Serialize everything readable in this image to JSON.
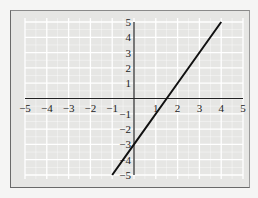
{
  "chart_data": {
    "type": "line",
    "title": "",
    "xlabel": "",
    "ylabel": "",
    "xlim": [
      -5,
      5
    ],
    "ylim": [
      -5,
      5
    ],
    "grid": true,
    "x_ticks": [
      "-5",
      "-4",
      "-3",
      "-2",
      "-1",
      "1",
      "2",
      "3",
      "4",
      "5"
    ],
    "y_ticks": [
      "5",
      "4",
      "3",
      "2",
      "1",
      "-1",
      "-2",
      "-3",
      "-4",
      "-5"
    ],
    "series": [
      {
        "name": "y = 2x - 3",
        "equation": "y = 2x - 3",
        "x": [
          -1,
          0,
          1.5,
          4
        ],
        "y": [
          -5,
          -3,
          0,
          5
        ],
        "color": "#111111"
      }
    ],
    "colors": {
      "plot_background": "#e6e6e4",
      "grid": "#ffffff",
      "axes": "#222222",
      "line": "#111111"
    }
  }
}
